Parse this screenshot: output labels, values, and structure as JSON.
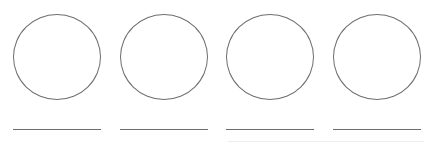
{
  "canvas": {
    "width": 432,
    "height": 146,
    "background": "#ffffff"
  },
  "stroke_color": "#6e6e6e",
  "items": [
    {
      "shape": "circle",
      "answer_line": ""
    },
    {
      "shape": "circle",
      "answer_line": ""
    },
    {
      "shape": "circle",
      "answer_line": ""
    },
    {
      "shape": "circle",
      "answer_line": ""
    }
  ]
}
